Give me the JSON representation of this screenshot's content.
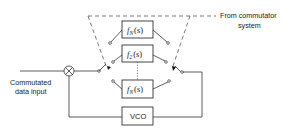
{
  "diagram": {
    "type": "block-diagram",
    "input_label_line1": "Commutated",
    "input_label_line2": "data input",
    "control_label_line1": "From commutator",
    "control_label_line2": "system",
    "blocks": [
      {
        "id": "filter-n-top",
        "label_main": "f",
        "label_sub": "N",
        "label_arg": "(s)"
      },
      {
        "id": "filter-2",
        "label_main": "f",
        "label_sub": "2",
        "label_arg": "(s)"
      },
      {
        "id": "filter-n-bottom",
        "label_main": "f",
        "label_sub": "N",
        "label_arg": "(s)"
      },
      {
        "id": "vco",
        "label": "VCO"
      }
    ],
    "multiplier_symbol": "⊗",
    "connections": [
      "input -> multiplier",
      "multiplier -> input commutator switch",
      "input switch -> filter bank (f_N, f_2, ..., f_N)",
      "filter bank -> output commutator switch",
      "output switch -> VCO",
      "VCO -> multiplier (feedback)",
      "commutator system -> both switches (dashed mechanical link)"
    ]
  }
}
